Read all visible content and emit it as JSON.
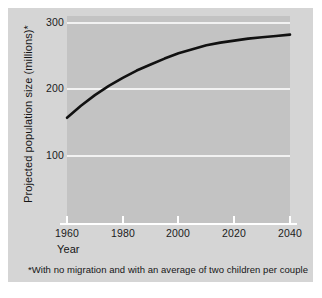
{
  "chart_data": {
    "type": "line",
    "title": "",
    "subtitle": "",
    "xlabel": "Year",
    "ylabel": "Projected population size (millions)*",
    "xlim": [
      1960,
      2040
    ],
    "ylim": [
      0,
      320
    ],
    "xticks": [
      "1960",
      "1980",
      "2000",
      "2020",
      "2040"
    ],
    "yticks": [
      "100",
      "200",
      "300"
    ],
    "grid": true,
    "legend": "none",
    "annotations": [
      "*With no migration and with an average of two children per couple"
    ],
    "series": [
      {
        "name": "Projected U.S. population",
        "x": [
          1960,
          1965,
          1970,
          1975,
          1980,
          1985,
          1990,
          1995,
          2000,
          2005,
          2010,
          2015,
          2020,
          2025,
          2030,
          2035,
          2040
        ],
        "values": [
          156,
          174,
          190,
          204,
          216,
          227,
          236,
          245,
          253,
          259,
          265,
          269,
          272,
          275,
          277,
          279,
          281
        ]
      }
    ],
    "colors": {
      "line": "#111111",
      "panel": "#c3c3c3",
      "card": "#d5d5d5",
      "gridline": "#f2f2f2",
      "text": "#161616"
    }
  },
  "footnote": {
    "text": "*With no migration and with an average of two children per couple"
  },
  "axis": {
    "x_title": "Year",
    "y_title": "Projected population size (millions)*"
  }
}
